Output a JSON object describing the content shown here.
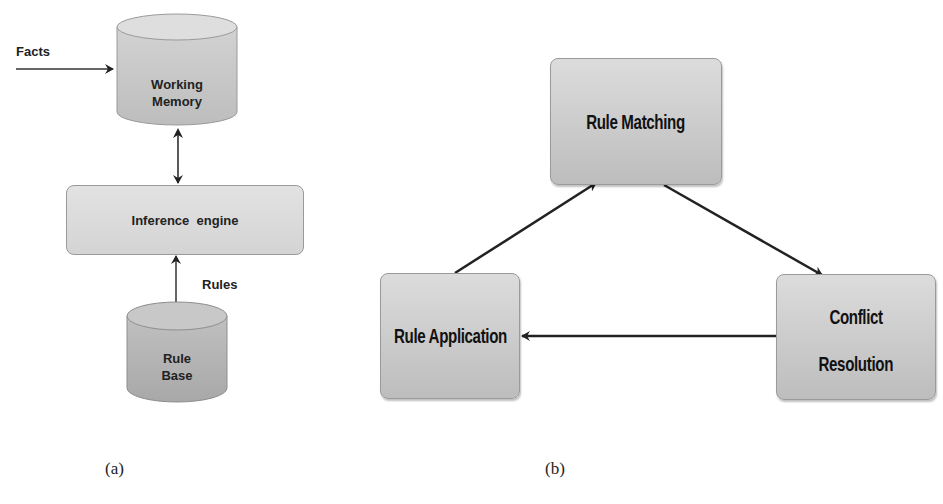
{
  "diagram_a": {
    "caption": "(a)",
    "facts_label": "Facts",
    "working_memory": {
      "line1": "Working",
      "line2": "Memory"
    },
    "inference_engine": "Inference  engine",
    "rules_label": "Rules",
    "rule_base": {
      "line1": "Rule",
      "line2": "Base"
    }
  },
  "diagram_b": {
    "caption": "(b)",
    "rule_matching": "Rule Matching",
    "rule_application": "Rule Application",
    "conflict_resolution": {
      "line1": "Conflict",
      "line2": "Resolution"
    }
  },
  "colors": {
    "box_fill": "#d6d6d6",
    "cylinder_dark": "#aaaaaa",
    "arrow": "#222222"
  }
}
